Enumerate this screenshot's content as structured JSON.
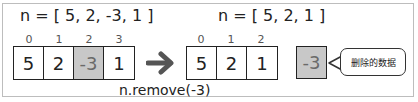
{
  "before": {
    "label": "n = [ 5, 2, -3, 1 ]",
    "indices": [
      "0",
      "1",
      "2",
      "3"
    ],
    "values": [
      "5",
      "2",
      "-3",
      "1"
    ],
    "highlighted_index": 2
  },
  "after": {
    "label": "n = [ 5, 2, 1 ]",
    "indices": [
      "0",
      "1",
      "2"
    ],
    "values": [
      "5",
      "2",
      "1"
    ]
  },
  "operation": "n.remove(-3)",
  "removed": {
    "value": "-3",
    "callout": "删除的数据"
  },
  "colors": {
    "highlight_fill": "#c8c8c8",
    "arrow": "#555555"
  }
}
